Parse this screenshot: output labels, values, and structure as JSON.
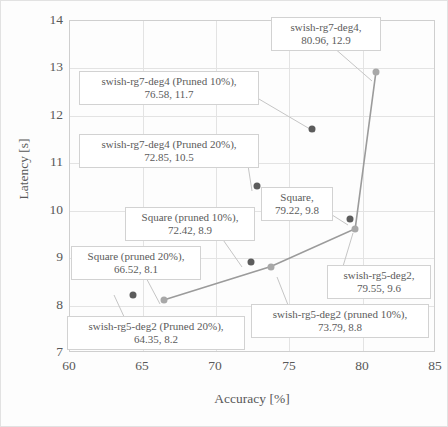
{
  "chart_data": {
    "type": "scatter",
    "title": "",
    "xlabel": "Accuracy [%]",
    "ylabel": "Latency [s]",
    "xlim": [
      60,
      85
    ],
    "ylim": [
      7,
      14
    ],
    "xticks": [
      60,
      65,
      70,
      75,
      80,
      85
    ],
    "yticks": [
      7,
      8,
      9,
      10,
      11,
      12,
      13,
      14
    ],
    "grid": true,
    "legend": "none",
    "points": [
      {
        "name": "swish-rg7-deg4",
        "x": 80.96,
        "y": 12.9,
        "marker": "light"
      },
      {
        "name": "swish-rg7-deg4 (Pruned 10%)",
        "x": 76.58,
        "y": 11.7,
        "marker": "dark"
      },
      {
        "name": "swish-rg7-deg4 (Pruned 20%)",
        "x": 72.85,
        "y": 10.5,
        "marker": "dark"
      },
      {
        "name": "Square",
        "x": 79.22,
        "y": 9.8,
        "marker": "dark"
      },
      {
        "name": "swish-rg5-deg2",
        "x": 79.55,
        "y": 9.6,
        "marker": "light"
      },
      {
        "name": "Square (pruned 10%)",
        "x": 72.42,
        "y": 8.9,
        "marker": "dark"
      },
      {
        "name": "swish-rg5-deg2 (pruned 10%)",
        "x": 73.79,
        "y": 8.8,
        "marker": "light"
      },
      {
        "name": "swish-rg5-deg2 (Pruned 20%)",
        "x": 64.35,
        "y": 8.2,
        "marker": "dark"
      },
      {
        "name": "Square (pruned 20%)",
        "x": 66.52,
        "y": 8.1,
        "marker": "light"
      }
    ],
    "series": [
      {
        "name": "swish-rg5-deg2 line",
        "x": [
          66.52,
          73.79,
          79.55,
          80.96
        ],
        "y": [
          8.1,
          8.8,
          9.6,
          12.9
        ]
      }
    ],
    "annotations": [
      {
        "id": "a1",
        "line1": "swish-rg7-deg4,",
        "line2": "80.96, 12.9"
      },
      {
        "id": "a2",
        "line1": "swish-rg7-deg4 (Pruned 10%),",
        "line2": "76.58, 11.7"
      },
      {
        "id": "a3",
        "line1": "swish-rg7-deg4 (Pruned 20%),",
        "line2": "72.85, 10.5"
      },
      {
        "id": "a4",
        "line1": "Square,",
        "line2": "79.22, 9.8"
      },
      {
        "id": "a5",
        "line1": "Square (pruned 10%),",
        "line2": "72.42, 8.9"
      },
      {
        "id": "a6",
        "line1": "Square (pruned 20%),",
        "line2": "66.52, 8.1"
      },
      {
        "id": "a7",
        "line1": "swish-rg5-deg2,",
        "line2": "79.55, 9.6"
      },
      {
        "id": "a8",
        "line1": "swish-rg5-deg2 (pruned 10%),",
        "line2": "73.79, 8.8"
      },
      {
        "id": "a9",
        "line1": "swish-rg5-deg2 (Pruned 20%),",
        "line2": "64.35, 8.2"
      }
    ],
    "colors": {
      "marker_dark": "#5c5c5c",
      "marker_light": "#a8a8a8",
      "line": "#9b9b9b",
      "grid": "#e3e3e3",
      "axis": "#cfcfcf",
      "text": "#585858",
      "callout_border": "#d2d2d2"
    }
  },
  "axis": {
    "xticks": [
      "60",
      "65",
      "70",
      "75",
      "80",
      "85"
    ],
    "yticks": [
      "14",
      "13",
      "12",
      "11",
      "10",
      "9",
      "8",
      "7"
    ],
    "xtitle": "Accuracy [%]",
    "ytitle": "Latency [s]"
  }
}
